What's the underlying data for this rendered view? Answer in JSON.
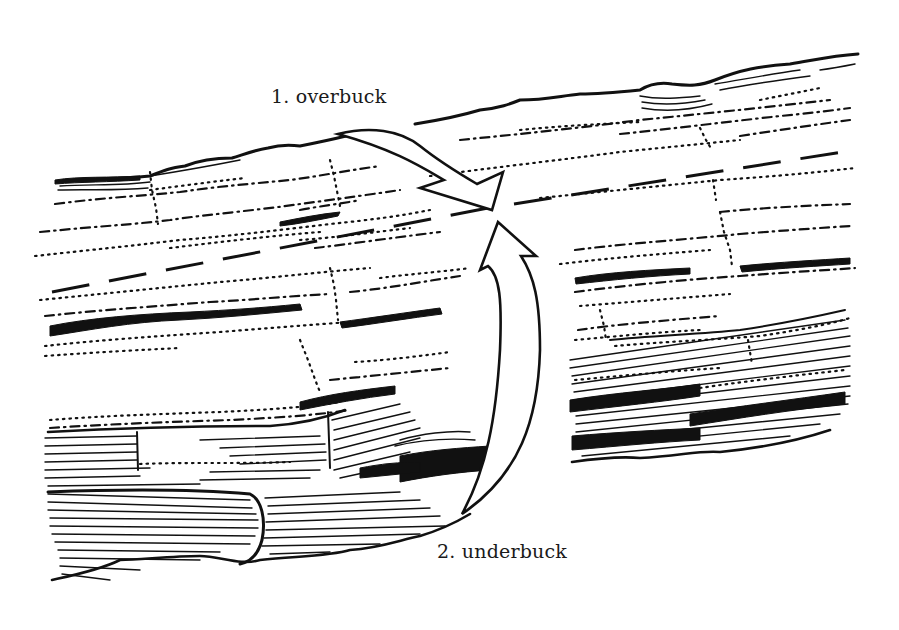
{
  "figure": {
    "labels": {
      "overbuck": "1. overbuck",
      "underbuck": "2. underbuck"
    },
    "elements": {
      "cut_line": "dashed-cut-line",
      "overbuck_arrow": "arrow pointing down-right from top toward cut point",
      "underbuck_arrow": "arrow curving up from bottom toward cut point"
    },
    "colors": {
      "ink": "#111111",
      "paper": "#ffffff"
    }
  }
}
